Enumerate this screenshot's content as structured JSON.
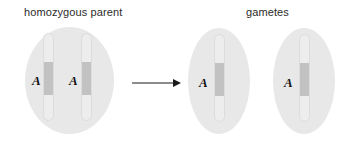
{
  "figure": {
    "width": 352,
    "height": 152,
    "background": "#ffffff"
  },
  "labels": {
    "parent": "homozygous parent",
    "gametes": "gametes"
  },
  "colors": {
    "cell_fill": "#e8e8e8",
    "chromosome_fill": "#ededed",
    "chromosome_outline": "#dcdcdc",
    "chromosome_band": "#c2c2c2",
    "text": "#2b2b2b",
    "allele_text": "#111111",
    "arrow": "#1a1a1a"
  },
  "parent_cell": {
    "shape": "circle",
    "alleles": [
      "A",
      "A"
    ],
    "chromosome_count": 2,
    "genotype": "AA"
  },
  "gametes": [
    {
      "shape": "ellipse",
      "allele": "A",
      "chromosome_count": 1
    },
    {
      "shape": "ellipse",
      "allele": "A",
      "chromosome_count": 1
    }
  ],
  "arrow": {
    "direction": "right",
    "icon": "arrow-right-icon"
  }
}
